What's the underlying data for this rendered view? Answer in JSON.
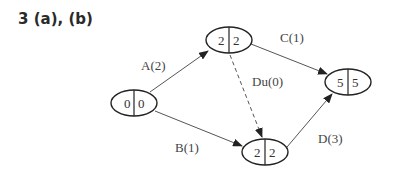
{
  "title": "3 (a), (b)",
  "nodes": [
    {
      "id": "n1",
      "left": "0",
      "right": "0",
      "cx": 134,
      "cy": 103
    },
    {
      "id": "n2",
      "left": "2",
      "right": "2",
      "cx": 229,
      "cy": 40
    },
    {
      "id": "n3",
      "left": "5",
      "right": "5",
      "cx": 348,
      "cy": 82
    },
    {
      "id": "n4",
      "left": "2",
      "right": "2",
      "cx": 265,
      "cy": 152
    }
  ],
  "edges": [
    {
      "label": "A(2)",
      "from": "n1",
      "to": "n2",
      "dashed": false
    },
    {
      "label": "B(1)",
      "from": "n1",
      "to": "n4",
      "dashed": false
    },
    {
      "label": "C(1)",
      "from": "n2",
      "to": "n3",
      "dashed": false
    },
    {
      "label": "Du(0)",
      "from": "n2",
      "to": "n4",
      "dashed": true
    },
    {
      "label": "D(3)",
      "from": "n4",
      "to": "n3",
      "dashed": false
    }
  ]
}
